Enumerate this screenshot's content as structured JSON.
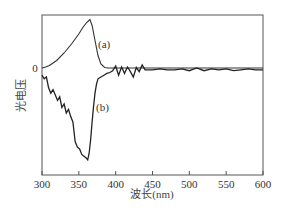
{
  "chart_data": {
    "type": "line",
    "title": "",
    "xlabel": "波长(nm)",
    "ylabel": "光电压",
    "xlim": [
      300,
      600
    ],
    "xticks": [
      300,
      350,
      400,
      450,
      500,
      550,
      600
    ],
    "yticks_labels": [
      "0"
    ],
    "grid": false,
    "legend": "inline labels",
    "series": [
      {
        "name": "(a)",
        "label": "(a)",
        "x": [
          300,
          305,
          310,
          320,
          330,
          340,
          350,
          355,
          360,
          365,
          368,
          372,
          376,
          380,
          385,
          390,
          400,
          450,
          500,
          550,
          600
        ],
        "y": [
          0.0,
          0.02,
          0.05,
          0.15,
          0.3,
          0.48,
          0.68,
          0.8,
          0.9,
          0.97,
          0.85,
          0.55,
          0.25,
          0.08,
          0.01,
          0.0,
          0.0,
          0.0,
          0.0,
          0.0,
          0.0
        ]
      },
      {
        "name": "(b)",
        "label": "(b)",
        "x": [
          300,
          303,
          306,
          309,
          312,
          315,
          318,
          321,
          324,
          327,
          330,
          333,
          336,
          339,
          342,
          345,
          348,
          351,
          354,
          357,
          360,
          362,
          364,
          366,
          368,
          370,
          372,
          374,
          376,
          380,
          384,
          388,
          392,
          396,
          400,
          404,
          408,
          412,
          416,
          420,
          424,
          428,
          432,
          436,
          440,
          450,
          460,
          470,
          480,
          490,
          500,
          510,
          520,
          530,
          540,
          550,
          560,
          570,
          580,
          590,
          600
        ],
        "y": [
          -0.08,
          -0.12,
          -0.1,
          -0.22,
          -0.28,
          -0.24,
          -0.3,
          -0.36,
          -0.32,
          -0.44,
          -0.4,
          -0.5,
          -0.46,
          -0.54,
          -0.6,
          -0.82,
          -0.88,
          -0.9,
          -0.96,
          -0.98,
          -1.0,
          -1.02,
          -0.95,
          -0.8,
          -0.6,
          -0.42,
          -0.28,
          -0.18,
          -0.12,
          -0.1,
          -0.08,
          -0.06,
          -0.05,
          -0.03,
          0.04,
          -0.08,
          0.02,
          -0.06,
          0.02,
          -0.04,
          -0.1,
          0.01,
          -0.04,
          0.06,
          -0.02,
          -0.02,
          -0.01,
          -0.02,
          -0.02,
          -0.01,
          -0.03,
          0.0,
          -0.03,
          -0.01,
          -0.02,
          -0.01,
          -0.03,
          -0.02,
          -0.01,
          -0.02,
          -0.02
        ]
      }
    ],
    "annotations": [
      {
        "text": "(a)",
        "x": 372,
        "y": 0.55
      },
      {
        "text": "(b)",
        "x": 378,
        "y": -0.42
      }
    ]
  },
  "axes": {
    "x_ticks": [
      "300",
      "350",
      "400",
      "450",
      "500",
      "550",
      "600"
    ],
    "y_zero_label": "0",
    "xlabel": "波长(nm)",
    "ylabel": "光电压"
  }
}
